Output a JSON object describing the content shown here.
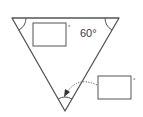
{
  "diagram": {
    "type": "equilateral-triangle-angles",
    "stroke_color": "#555555",
    "triangle": {
      "orientation": "inverted",
      "vertices": {
        "top_left": [
          12,
          18
        ],
        "top_right": [
          119,
          18
        ],
        "bottom": [
          65,
          111
        ]
      }
    },
    "angles": {
      "top_left": {
        "label": "",
        "input_box": true,
        "unit": "°"
      },
      "top_right": {
        "label": "60°",
        "input_box": false
      },
      "bottom": {
        "label": "",
        "input_box": true,
        "unit": "°",
        "pointer": "dotted-arrow"
      }
    },
    "known_angle_text": "60°",
    "box1_unit": "°",
    "box2_unit": "°"
  }
}
